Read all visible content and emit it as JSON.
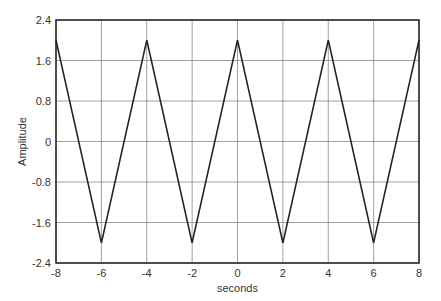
{
  "chart_data": {
    "type": "line",
    "title": "",
    "xlabel": "seconds",
    "ylabel": "Amplitude",
    "xlim": [
      -8,
      8
    ],
    "ylim": [
      -2.4,
      2.4
    ],
    "grid": true,
    "legend": null,
    "x_ticks": [
      "-8",
      "-6",
      "-4",
      "-2",
      "0",
      "2",
      "4",
      "6",
      "8"
    ],
    "y_ticks": [
      "2.4",
      "1.6",
      "0.8",
      "0",
      "-0.8",
      "-1.6",
      "-2.4"
    ],
    "series": [
      {
        "name": "triangle wave",
        "x": [
          -8,
          -6,
          -4,
          -2,
          0,
          2,
          4,
          6,
          8
        ],
        "y": [
          2,
          -2,
          2,
          -2,
          2,
          -2,
          2,
          -2,
          2
        ]
      }
    ]
  }
}
